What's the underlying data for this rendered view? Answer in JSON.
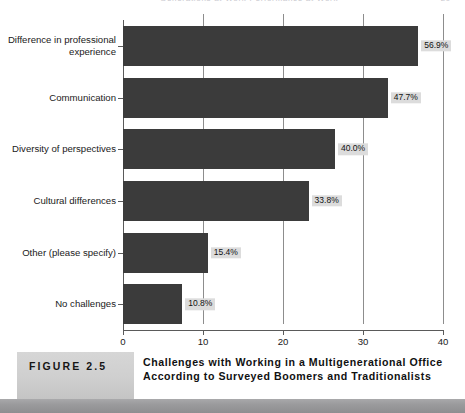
{
  "running_head": {
    "text": "Generations at Work Performance at Work",
    "page_number": "29"
  },
  "chart_data": {
    "type": "bar",
    "orientation": "horizontal",
    "title": "Challenges with Working in a Multigenerational Office According to Surveyed Boomers and Traditionalists",
    "xlabel": "",
    "ylabel": "",
    "xlim": [
      0,
      40
    ],
    "xticks": [
      "0",
      "10",
      "20",
      "30",
      "40"
    ],
    "grid": true,
    "legend": "none",
    "bar_color": "#3b3b3b",
    "label_background": "#dcdcdc",
    "categories": [
      "Difference in professional experience",
      "Communication",
      "Diversity of perspectives",
      "Cultural differences",
      "Other (please specify)",
      "No challenges"
    ],
    "values": [
      36.9,
      33.1,
      26.5,
      23.2,
      10.6,
      7.4
    ],
    "data_labels": [
      "56.9%",
      "47.7%",
      "40.0%",
      "33.8%",
      "15.4%",
      "10.8%"
    ]
  },
  "caption": {
    "figure_tag": "FIGURE 2.5",
    "text": "Challenges with Working in a Multigenerational Office According to Surveyed Boomers and Traditionalists"
  }
}
